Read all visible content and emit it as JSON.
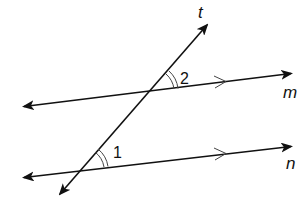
{
  "diagram": {
    "colors": {
      "line": "#111111",
      "arc": "#444444",
      "background": "#ffffff"
    },
    "lines": [
      {
        "id": "m",
        "label": "m",
        "x1": 20,
        "y1": 107,
        "x2": 295,
        "y2": 73
      },
      {
        "id": "n",
        "label": "n",
        "x1": 20,
        "y1": 178,
        "x2": 295,
        "y2": 146
      },
      {
        "id": "t",
        "label": "t",
        "x1": 58,
        "y1": 197,
        "x2": 210,
        "y2": 22
      }
    ],
    "labels": {
      "t": "t",
      "m": "m",
      "n": "n",
      "angle1": "1",
      "angle2": "2"
    },
    "angles": [
      {
        "id": "angle-1",
        "label": "1",
        "vertex": [
          80,
          170
        ],
        "marks": 2
      },
      {
        "id": "angle-2",
        "label": "2",
        "vertex": [
          150,
          92
        ],
        "marks": 2
      }
    ],
    "parallel_markers": [
      {
        "on": "m",
        "x": 222,
        "y": 82
      },
      {
        "on": "n",
        "x": 222,
        "y": 154
      }
    ]
  }
}
